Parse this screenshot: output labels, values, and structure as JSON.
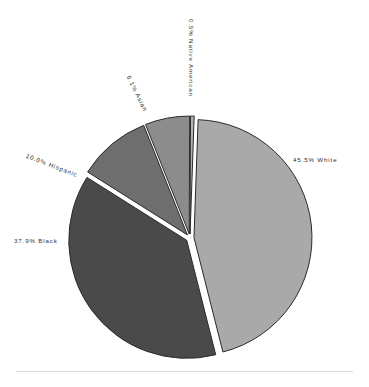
{
  "chart_data": {
    "type": "pie",
    "title": "",
    "subtitle": "",
    "xlabel": "",
    "ylabel": "",
    "legend_position": "none",
    "grid": false,
    "labels_rotated": true,
    "exploded": true,
    "start_angle_deg": -88,
    "direction": "clockwise",
    "categories": [
      "White",
      "Black",
      "Hispanic",
      "Asian",
      "Native American"
    ],
    "values": [
      45.5,
      37.9,
      10.0,
      6.1,
      0.5
    ],
    "value_unit": "%",
    "total": 100.0,
    "data_labels": [
      "45.5% White",
      "37.9% Black",
      "10.0% Hispanic",
      "6.1% Asian",
      "0.5% Native American"
    ],
    "colors": [
      "#a9a9a9",
      "#4a4a4a",
      "#6e6e6e",
      "#8c8c8c",
      "#b2b2b2"
    ],
    "edge_color": "#2b2b2b",
    "slices": [
      {
        "label": "45.5% White",
        "name": "White",
        "value": 45.5,
        "color": "#a9a9a9",
        "label_x": 293,
        "label_y": 160,
        "label_rotation": 0,
        "label_anchor": "start"
      },
      {
        "label": "37.9% Black",
        "name": "Black",
        "value": 37.9,
        "color": "#4a4a4a",
        "label_x": 14,
        "label_y": 241,
        "label_rotation": 0,
        "label_anchor": "start"
      },
      {
        "label": "10.0% Hispanic",
        "name": "Hispanic",
        "value": 10.0,
        "color": "#6e6e6e",
        "label_x": 26,
        "label_y": 156,
        "label_rotation": 21,
        "label_anchor": "start"
      },
      {
        "label": "6.1% Asian",
        "name": "Asian",
        "value": 6.1,
        "color": "#8c8c8c",
        "label_x": 128,
        "label_y": 76,
        "label_rotation": 64,
        "label_anchor": "start"
      },
      {
        "label": "0.5% Native American",
        "name": "Native American",
        "value": 0.5,
        "color": "#b2b2b2",
        "label_x": 191,
        "label_y": 19,
        "label_rotation": 90,
        "label_anchor": "start"
      }
    ],
    "geometry": {
      "center_x": 190,
      "center_y": 238,
      "radius": 118,
      "explode_offset": 4
    }
  },
  "footer": {
    "divider": true
  }
}
